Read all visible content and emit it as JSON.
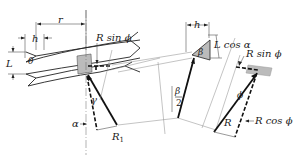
{
  "diagram": {
    "left_view": {
      "labels": {
        "r": "r",
        "h": "h",
        "L": "L",
        "theta": "θ",
        "r_sin_phi": "R sin ϕ",
        "gamma": "γ",
        "alpha": "α",
        "R1": "R",
        "R1_sub": "1"
      }
    },
    "middle_view": {
      "labels": {
        "h": "h",
        "beta": "β",
        "beta_half_num": "β",
        "beta_half_den": "2",
        "L_cos_alpha": "L cos α"
      }
    },
    "right_view": {
      "labels": {
        "r_sin_phi": "R sin ϕ",
        "phi": "ϕ",
        "R": "R",
        "r_cos_phi": "R cos ϕ"
      }
    },
    "colors": {
      "line": "#111111",
      "shade": "#bbbbbb",
      "background": "#ffffff"
    }
  }
}
